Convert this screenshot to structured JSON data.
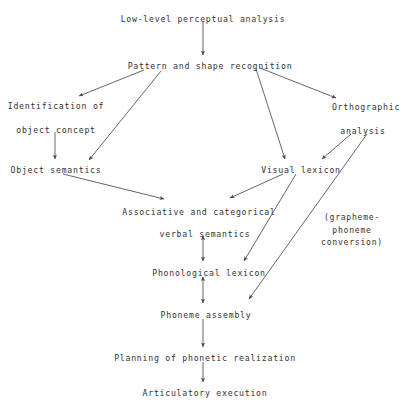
{
  "diagram": {
    "type": "flowchart",
    "title_node": "low-level-perceptual-analysis",
    "nodes": [
      {
        "id": "low_level",
        "label": "Low-level perceptual analysis",
        "x": 203,
        "y": 13
      },
      {
        "id": "pattern_shape",
        "label": "Pattern and shape recognition",
        "x": 210,
        "y": 60
      },
      {
        "id": "identification",
        "label": "Identification of",
        "x": 56,
        "y": 100
      },
      {
        "id": "object_concept",
        "label": "object concept",
        "x": 56,
        "y": 124
      },
      {
        "id": "orthographic",
        "label": "Orthographic",
        "x": 366,
        "y": 101
      },
      {
        "id": "analysis",
        "label": "analysis",
        "x": 363,
        "y": 125
      },
      {
        "id": "object_sem",
        "label": "Object semantics",
        "x": 56,
        "y": 164
      },
      {
        "id": "visual_lexicon",
        "label": "Visual lexicon",
        "x": 301,
        "y": 164
      },
      {
        "id": "assoc_cat",
        "label": "Associative and categorical",
        "x": 199,
        "y": 206
      },
      {
        "id": "verbal_sem",
        "label": "verbal semantics",
        "x": 205,
        "y": 228
      },
      {
        "id": "phono_lexicon",
        "label": "Phonological lexicon",
        "x": 209,
        "y": 267
      },
      {
        "id": "phoneme_asm",
        "label": "Phoneme assembly",
        "x": 206,
        "y": 309
      },
      {
        "id": "planning",
        "label": "Planning of phonetic realization",
        "x": 205,
        "y": 352
      },
      {
        "id": "articulatory",
        "label": "Articulatory execution",
        "x": 205,
        "y": 387
      }
    ],
    "annotations": [
      {
        "id": "gp_conversion",
        "lines": "(grapheme-\nphoneme\nconversion)",
        "x": 352,
        "y": 211
      }
    ],
    "edges": [
      {
        "from": "low_level",
        "to": "pattern_shape",
        "kind": "single"
      },
      {
        "from": "pattern_shape",
        "to": "identification",
        "kind": "single"
      },
      {
        "from": "pattern_shape",
        "to": "object_sem",
        "kind": "single"
      },
      {
        "from": "pattern_shape",
        "to": "orthographic",
        "kind": "single"
      },
      {
        "from": "pattern_shape",
        "to": "visual_lexicon",
        "kind": "single"
      },
      {
        "from": "object_concept",
        "to": "object_sem",
        "kind": "single"
      },
      {
        "from": "analysis",
        "to": "visual_lexicon",
        "kind": "single"
      },
      {
        "from": "analysis",
        "to": "phoneme_asm",
        "kind": "single"
      },
      {
        "from": "object_sem",
        "to": "assoc_cat",
        "kind": "single"
      },
      {
        "from": "visual_lexicon",
        "to": "assoc_cat",
        "kind": "single"
      },
      {
        "from": "visual_lexicon",
        "to": "phono_lexicon",
        "kind": "single"
      },
      {
        "from": "verbal_sem",
        "to": "phono_lexicon",
        "kind": "double"
      },
      {
        "from": "phono_lexicon",
        "to": "phoneme_asm",
        "kind": "double"
      },
      {
        "from": "phoneme_asm",
        "to": "planning",
        "kind": "single"
      },
      {
        "from": "planning",
        "to": "articulatory",
        "kind": "single"
      }
    ],
    "colors": {
      "line": "#4a4a4a",
      "text": "#333333",
      "background": "#ffffff"
    }
  }
}
